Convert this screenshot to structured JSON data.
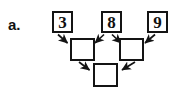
{
  "problem": {
    "label": "a.",
    "type": "arrow-flow-diagram"
  },
  "colors": {
    "ink": "#141414",
    "paper": "#ffffff",
    "text": "#111111"
  },
  "diagram": {
    "rows": {
      "top": {
        "boxes": [
          {
            "id": "top-1",
            "value": "3",
            "filled": true
          },
          {
            "id": "top-2",
            "value": "8",
            "filled": true
          },
          {
            "id": "top-3",
            "value": "9",
            "filled": true
          }
        ]
      },
      "middle": {
        "boxes": [
          {
            "id": "mid-1",
            "value": "",
            "filled": false
          },
          {
            "id": "mid-2",
            "value": "",
            "filled": false
          }
        ]
      },
      "bottom": {
        "boxes": [
          {
            "id": "bottom-1",
            "value": "",
            "filled": false
          }
        ]
      }
    },
    "arrows": [
      {
        "id": "arrow-3-to-mid1",
        "from": "top-1",
        "to": "mid-1",
        "direction": "down-right"
      },
      {
        "id": "arrow-8-to-mid1",
        "from": "top-2",
        "to": "mid-1",
        "direction": "down-left"
      },
      {
        "id": "arrow-8-to-mid2",
        "from": "top-2",
        "to": "mid-2",
        "direction": "down-right"
      },
      {
        "id": "arrow-9-to-mid2",
        "from": "top-3",
        "to": "mid-2",
        "direction": "down-left"
      },
      {
        "id": "arrow-mid1-to-bottom",
        "from": "mid-1",
        "to": "bottom-1",
        "direction": "down-right"
      },
      {
        "id": "arrow-mid2-to-bottom",
        "from": "mid-2",
        "to": "bottom-1",
        "direction": "down-left"
      }
    ]
  }
}
